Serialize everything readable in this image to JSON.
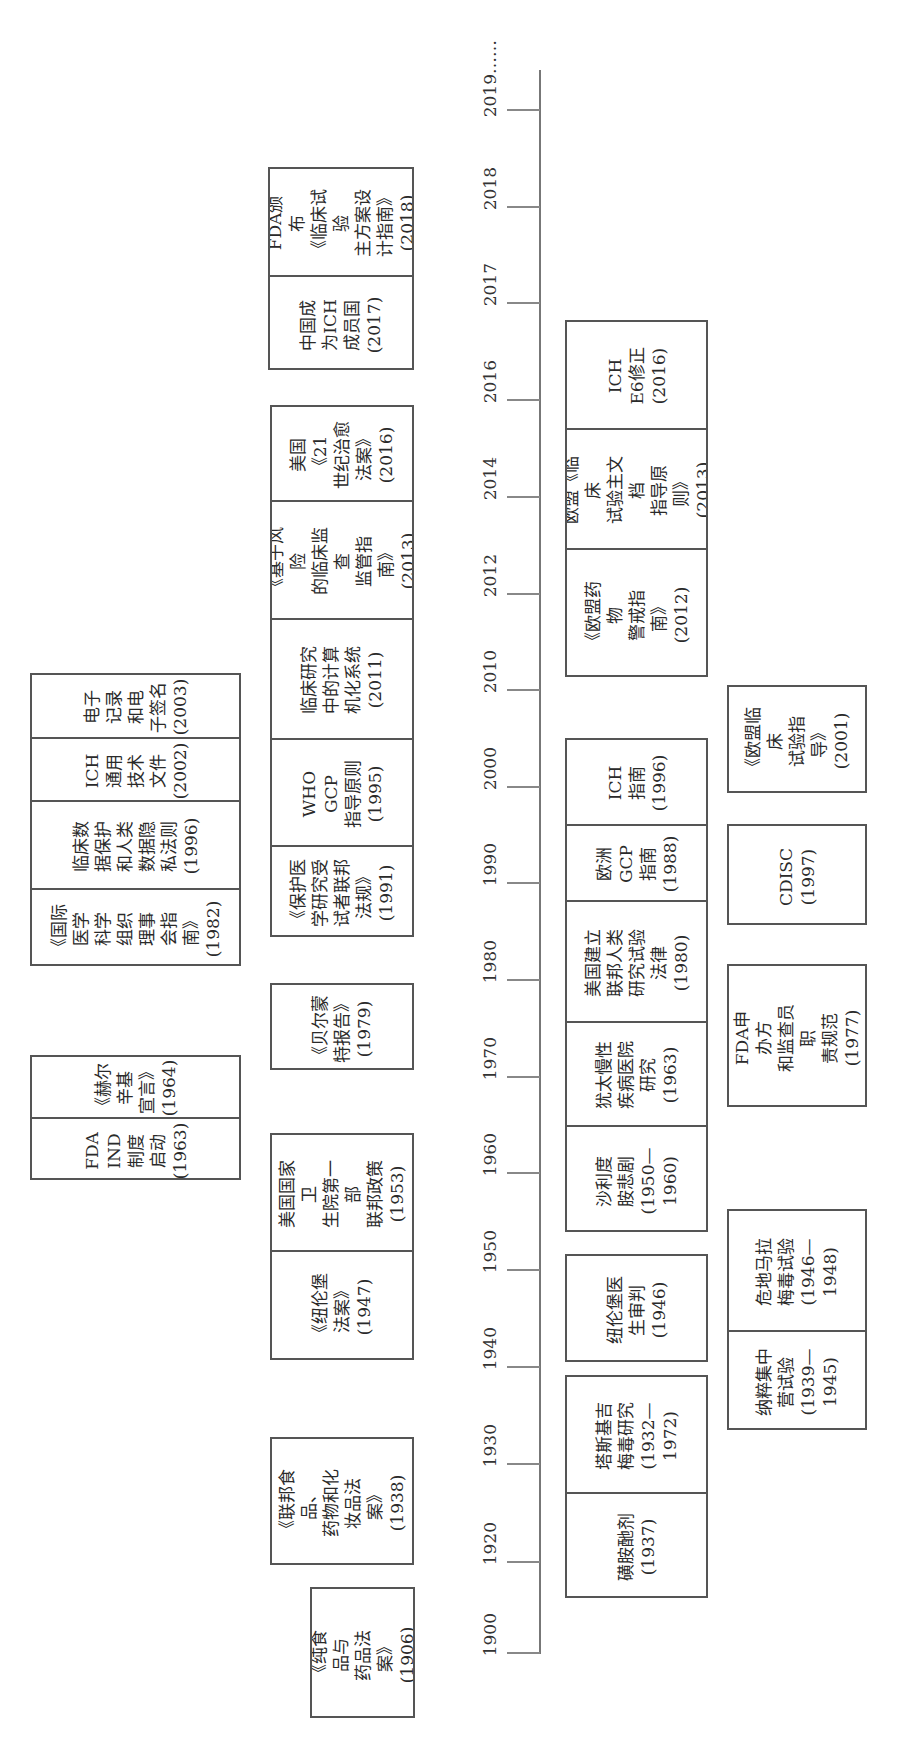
{
  "axis": {
    "ticks": [
      {
        "label": "2019……",
        "y": 110
      },
      {
        "label": "2018",
        "y": 207
      },
      {
        "label": "2017",
        "y": 303
      },
      {
        "label": "2016",
        "y": 400
      },
      {
        "label": "2014",
        "y": 497
      },
      {
        "label": "2012",
        "y": 594
      },
      {
        "label": "2010",
        "y": 690
      },
      {
        "label": "2000",
        "y": 787
      },
      {
        "label": "1990",
        "y": 883
      },
      {
        "label": "1980",
        "y": 980
      },
      {
        "label": "1970",
        "y": 1077
      },
      {
        "label": "1960",
        "y": 1173
      },
      {
        "label": "1950",
        "y": 1270
      },
      {
        "label": "1940",
        "y": 1367
      },
      {
        "label": "1930",
        "y": 1464
      },
      {
        "label": "1920",
        "y": 1562
      },
      {
        "label": "1900",
        "y": 1653
      }
    ]
  },
  "boxes": [
    {
      "id": "far-left-recent",
      "x": 30,
      "y": 673,
      "w": 211,
      "h": 293,
      "cells": [
        {
          "h": 64,
          "text": "电子\n记录\n和电\n子签名\n(2003)"
        },
        {
          "h": 63,
          "text": "ICH\n通用\n技术\n文件\n(2002)"
        },
        {
          "h": 88,
          "text": "临床数\n据保护\n和人类\n数据隐\n私法则\n(1996)"
        },
        {
          "h": 78,
          "text": "《国际\n医学\n科学\n组织\n理事\n会指\n南》\n(1982)"
        }
      ]
    },
    {
      "id": "far-left-1960s",
      "x": 30,
      "y": 1055,
      "w": 211,
      "h": 125,
      "cells": [
        {
          "h": 62,
          "text": "《赫尔\n辛基\n宣言》\n(1964)"
        },
        {
          "h": 63,
          "text": "FDA\nIND\n制度\n启动\n(1963)"
        }
      ]
    },
    {
      "id": "mid-left-2017",
      "x": 268,
      "y": 167,
      "w": 146,
      "h": 203,
      "cells": [
        {
          "h": 108,
          "text": "FDA颁布\n《临床试验\n主方案设\n计指南》\n(2018)"
        },
        {
          "h": 95,
          "text": "中国成\n为ICH\n成员国\n(2017)"
        }
      ]
    },
    {
      "id": "mid-left-stack",
      "x": 270,
      "y": 405,
      "w": 144,
      "h": 532,
      "cells": [
        {
          "h": 95,
          "text": "美国《21\n世纪治愈\n法案》\n(2016)"
        },
        {
          "h": 118,
          "text": "《基于风险\n的临床监查\n监管指南》\n(2013)"
        },
        {
          "h": 120,
          "text": "临床研究\n中的计算\n机化系统\n(2011)"
        },
        {
          "h": 107,
          "text": "WHO GCP\n指导原则\n(1995)"
        },
        {
          "h": 92,
          "text": "《保护医\n学研究受\n试者联邦\n法规》\n(1991)"
        }
      ]
    },
    {
      "id": "mid-left-1979",
      "x": 270,
      "y": 983,
      "w": 144,
      "h": 87,
      "cells": [
        {
          "h": 87,
          "text": "《贝尔蒙\n特报告》\n(1979)"
        }
      ]
    },
    {
      "id": "mid-left-1950s",
      "x": 270,
      "y": 1133,
      "w": 144,
      "h": 227,
      "cells": [
        {
          "h": 117,
          "text": "美国国家卫\n生院第一部\n联邦政策\n(1953)"
        },
        {
          "h": 110,
          "text": "《纽伦堡\n法案》\n(1947)"
        }
      ]
    },
    {
      "id": "mid-left-1938",
      "x": 270,
      "y": 1437,
      "w": 144,
      "h": 128,
      "cells": [
        {
          "h": 128,
          "text": "《联邦食品、\n药物和化\n妆品法案》\n(1938)"
        }
      ]
    },
    {
      "id": "mid-left-1906",
      "x": 310,
      "y": 1587,
      "w": 105,
      "h": 131,
      "cells": [
        {
          "h": 131,
          "text": "《纯食品与\n药品法案》\n(1906)"
        }
      ]
    },
    {
      "id": "inner-right-2010s",
      "x": 565,
      "y": 320,
      "w": 143,
      "h": 357,
      "cells": [
        {
          "h": 108,
          "text": "ICH\nE6修正\n(2016)"
        },
        {
          "h": 120,
          "text": "欧盟《临床\n试验主文档\n指导原则》\n(2013)"
        },
        {
          "h": 129,
          "text": "《欧盟药物\n警戒指南》\n(2012)"
        }
      ]
    },
    {
      "id": "inner-right-stack",
      "x": 565,
      "y": 738,
      "w": 143,
      "h": 494,
      "cells": [
        {
          "h": 86,
          "text": "ICH\n指南\n(1996)"
        },
        {
          "h": 76,
          "text": "欧洲\nGCP\n指南\n(1988)"
        },
        {
          "h": 121,
          "text": "美国建立\n联邦人类\n研究试验\n法律(1980)"
        },
        {
          "h": 104,
          "text": "犹太慢性\n疾病医院\n研究\n(1963)"
        },
        {
          "h": 107,
          "text": "沙利度\n胺悲剧\n(1950—\n1960)"
        }
      ]
    },
    {
      "id": "inner-right-1946",
      "x": 565,
      "y": 1254,
      "w": 143,
      "h": 108,
      "cells": [
        {
          "h": 108,
          "text": "纽伦堡医\n生审判\n(1946)"
        }
      ]
    },
    {
      "id": "inner-right-1930s",
      "x": 565,
      "y": 1375,
      "w": 143,
      "h": 223,
      "cells": [
        {
          "h": 117,
          "text": "塔斯基吉\n梅毒研究\n(1932—\n1972)"
        },
        {
          "h": 106,
          "text": "磺胺酏剂\n(1937)"
        }
      ]
    },
    {
      "id": "outer-right-2001",
      "x": 727,
      "y": 685,
      "w": 140,
      "h": 108,
      "cells": [
        {
          "h": 108,
          "text": "《欧盟临床\n试验指导》\n(2001)"
        }
      ]
    },
    {
      "id": "outer-right-1997",
      "x": 727,
      "y": 824,
      "w": 140,
      "h": 101,
      "cells": [
        {
          "h": 101,
          "text": "CDISC\n(1997)"
        }
      ]
    },
    {
      "id": "outer-right-1977",
      "x": 727,
      "y": 964,
      "w": 140,
      "h": 143,
      "cells": [
        {
          "h": 143,
          "text": "FDA申办方\n和监查员职\n责规范\n(1977)"
        }
      ]
    },
    {
      "id": "outer-right-1940s",
      "x": 727,
      "y": 1209,
      "w": 140,
      "h": 221,
      "cells": [
        {
          "h": 121,
          "text": "危地马拉\n梅毒试验\n(1946—\n1948)"
        },
        {
          "h": 100,
          "text": "纳粹集中\n营试验\n(1939—\n1945)"
        }
      ]
    }
  ]
}
